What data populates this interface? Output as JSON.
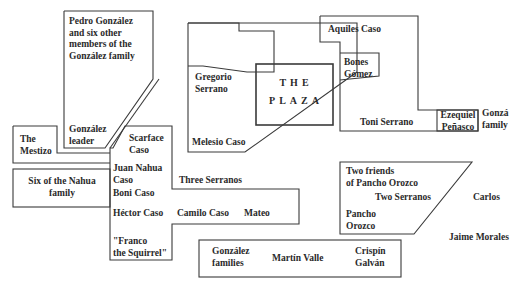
{
  "diagram": {
    "plaza": {
      "label": "THE\nPLAZA"
    },
    "labels": {
      "pedro": "Pedro González\nand six other\nmembers of the\nGonzález family",
      "gonzalez_leader": "González\nleader",
      "the_mestizo": "The\nMestizo",
      "scarface": "Scarface\nCaso",
      "juan_nahua": "Juan Nahua\n  Caso",
      "six_nahua": "Six of the Nahua\nfamily",
      "boni": "Boni Caso",
      "hector": "Héctor Caso",
      "camilo": "Camilo Caso",
      "mateo": "Mateo",
      "franco": "\"Franco\nthe Squirrel\"",
      "three_serranos": "Three Serranos",
      "gregorio": "Gregorio\nSerrano",
      "melesio": "Melesio Caso",
      "aquiles": "Aquiles Caso",
      "bones": "Bones\nGómez",
      "toni": "Toni Serrano",
      "ezequiel": "Ezequiel\nPeñasco",
      "gonzalez_family_right": "Gonzá\nfamily",
      "two_friends": "Two friends\nof Pancho Orozco",
      "two_serranos": "Two Serranos",
      "pancho": "Pancho\nOrozco",
      "carlos": "Carlos",
      "jaime": "Jaime Morales",
      "gonzalez_families": "González\nfamilies",
      "martin": "Martín Valle",
      "crispin": "Crispín\nGalván"
    },
    "colors": {
      "line": "#3a3a3a",
      "text": "#2a2a2a",
      "background": "#ffffff"
    }
  }
}
